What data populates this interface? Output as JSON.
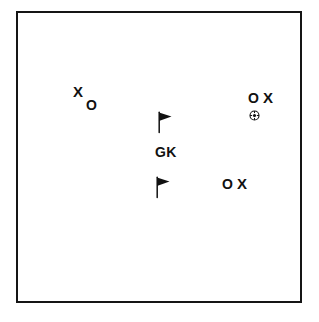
{
  "diagram": {
    "type": "soccer-tactical-diagram",
    "background_color": "#ffffff",
    "line_color": "#151515",
    "marker_color": "#111111",
    "boundary": {
      "name": "pitch-boundary",
      "x": 16,
      "y": 11,
      "width": 286,
      "height": 292,
      "stroke_width": 2
    },
    "labels": [
      {
        "id": "gk-label",
        "text": "GK",
        "x": 155,
        "y": 145
      }
    ],
    "markers": [
      {
        "id": "attacker-x-left",
        "symbol": "X",
        "kind": "x",
        "x": 73,
        "y": 84
      },
      {
        "id": "defender-o-left",
        "symbol": "O",
        "kind": "o",
        "x": 86,
        "y": 98
      },
      {
        "id": "defender-o-upper-right",
        "symbol": "O",
        "kind": "o",
        "x": 248,
        "y": 91
      },
      {
        "id": "attacker-x-upper-right",
        "symbol": "X",
        "kind": "x",
        "x": 263,
        "y": 90
      },
      {
        "id": "defender-o-lower-right",
        "symbol": "O",
        "kind": "o",
        "x": 222,
        "y": 177
      },
      {
        "id": "attacker-x-lower-right",
        "symbol": "X",
        "kind": "x",
        "x": 237,
        "y": 176
      }
    ],
    "flags": [
      {
        "id": "marker-flag-upper",
        "icon": "flag-icon",
        "x": 155,
        "y": 110
      },
      {
        "id": "marker-flag-lower",
        "icon": "flag-icon",
        "x": 153,
        "y": 175
      }
    ],
    "balls": [
      {
        "id": "soccer-ball",
        "icon": "soccer-ball-icon",
        "x": 249,
        "y": 110
      }
    ]
  }
}
